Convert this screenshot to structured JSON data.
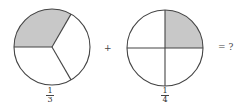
{
  "figure": {
    "fraction_a": {
      "numerator": "1",
      "denominator": "3",
      "parts": 3,
      "shaded": 1
    },
    "operator_plus": "+",
    "fraction_b": {
      "numerator": "1",
      "denominator": "4",
      "parts": 4,
      "shaded": 1
    },
    "equals_question": "= ?"
  },
  "colors": {
    "shade": "#c8c8c8",
    "stroke": "#444444",
    "background": "#ffffff"
  }
}
